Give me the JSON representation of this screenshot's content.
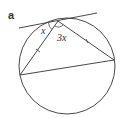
{
  "figure": {
    "part_label": "a",
    "angle_labels": {
      "tangent_chord_angle": "x",
      "inscribed_angle": "3x"
    },
    "colors": {
      "stroke": "#333333",
      "background": "#ffffff"
    },
    "elements": {
      "circle": {
        "cx": 67,
        "cy": 66,
        "r": 48
      },
      "tangent_line": {
        "x1": 19,
        "y1": 28,
        "x2": 97,
        "y2": 13
      },
      "tangent_point": {
        "x": 58,
        "y": 21
      },
      "left_vertex": {
        "x": 20,
        "y": 75
      },
      "right_vertex": {
        "x": 114,
        "y": 60
      }
    },
    "equal_side_marks": 2
  }
}
